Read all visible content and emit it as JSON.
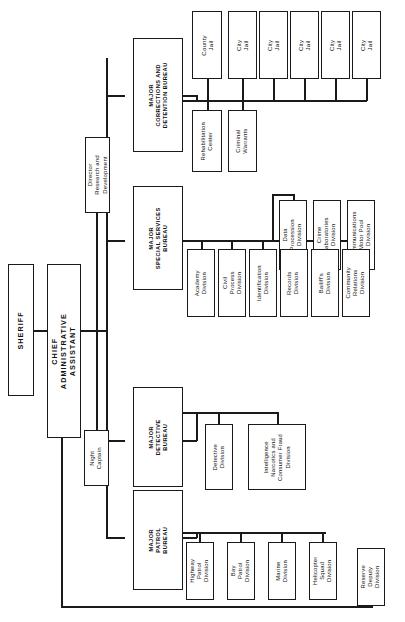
{
  "chart": {
    "orientation": "rotated-90",
    "line_color": "#1a1a1a",
    "box_fill": "#ffffff",
    "nodes": {
      "sheriff": "SHERIFF",
      "chief_administrative_assistant": "CHIEF\nADMINISTRATIVE\nASSISTANT",
      "director_research": "Director\nResearch and\nDevelopment",
      "night_captain": "Night\nCaptain",
      "major_corrections": "MAJOR\nCORRECTIONS AND\nDETENTION BUREAU",
      "major_special_services": "MAJOR\nSPECIAL SERVICES\nBUREAU",
      "major_detective": "MAJOR\nDETECTIVE\nBUREAU",
      "major_patrol": "MAJOR\nPATROL\nBUREAU",
      "rehabilitation_center": "Rehabilitation\nCenter",
      "criminal_warrants": "Criminal\nWarrants",
      "county_jail": "County\nJail",
      "city_jail_1": "City\nJail",
      "city_jail_2": "City\nJail",
      "city_jail_3": "City\nJail",
      "city_jail_4": "City\nJail",
      "city_jail_5": "City\nJail",
      "academy_division": "Academy\nDivision",
      "civil_process_division": "Civil\nProcess\nDivision",
      "identification_division": "Identification\nDivision",
      "records_division": "Records\nDivision",
      "bailiffs_division": "Bailiff's\nDivision",
      "community_relations_division": "Community\nRelations\nDivision",
      "data_processing_division": "Data\nProcession\nDivision",
      "crime_laboratories_division": "Crime\nLaboratories\nDivision",
      "communications_motor_pool_division": "Communications\nMotor Pool\nDivision",
      "detective_division": "Detective\nDivision",
      "intelligence_division": "Intelligence\nNarcotics and\nConsumer Fraud\nDivision",
      "highway_patrol_division": "Highway\nPatrol\nDivision",
      "bay_patrol_division": "Bay\nPatrol\nDivision",
      "marine_division": "Marine\nDivision",
      "helicopter_squad_division": "Helicopter\nSquad\nDivision",
      "reserve_deputy_division": "Reserve\nDeputy\nDivision"
    }
  }
}
